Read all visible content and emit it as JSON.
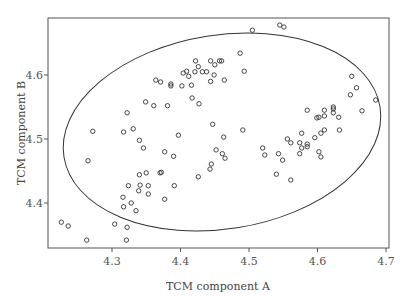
{
  "chart_data": {
    "type": "scatter",
    "title": "",
    "xlabel": "TCM component A",
    "ylabel": "TCM component B",
    "xlim": [
      4.21,
      4.705
    ],
    "ylim": [
      4.332,
      4.692
    ],
    "xticks": [
      4.3,
      4.4,
      4.5,
      4.6,
      4.7
    ],
    "yticks": [
      4.4,
      4.5,
      4.6
    ],
    "xtick_labels": [
      "4.3",
      "4.4",
      "4.5",
      "4.6",
      "4.7"
    ],
    "ytick_labels": [
      "4.4",
      "4.5",
      "4.6"
    ],
    "grid": false,
    "legend": null,
    "marker": "open-circle",
    "annotations": [
      {
        "type": "confidence-ellipse",
        "center": [
          4.465,
          4.511
        ],
        "note": "tilted ellipse enclosing most points"
      }
    ],
    "points": [
      [
        4.505,
        4.67
      ],
      [
        4.545,
        4.678
      ],
      [
        4.551,
        4.675
      ],
      [
        4.487,
        4.634
      ],
      [
        4.422,
        4.622
      ],
      [
        4.444,
        4.622
      ],
      [
        4.457,
        4.622
      ],
      [
        4.46,
        4.622
      ],
      [
        4.426,
        4.613
      ],
      [
        4.45,
        4.616
      ],
      [
        4.404,
        4.603
      ],
      [
        4.409,
        4.606
      ],
      [
        4.412,
        4.598
      ],
      [
        4.421,
        4.605
      ],
      [
        4.432,
        4.605
      ],
      [
        4.438,
        4.605
      ],
      [
        4.449,
        4.6
      ],
      [
        4.493,
        4.606
      ],
      [
        4.364,
        4.592
      ],
      [
        4.371,
        4.589
      ],
      [
        4.386,
        4.586
      ],
      [
        4.386,
        4.583
      ],
      [
        4.402,
        4.583
      ],
      [
        4.416,
        4.584
      ],
      [
        4.444,
        4.59
      ],
      [
        4.464,
        4.592
      ],
      [
        4.417,
        4.564
      ],
      [
        4.427,
        4.555
      ],
      [
        4.349,
        4.558
      ],
      [
        4.361,
        4.552
      ],
      [
        4.381,
        4.552
      ],
      [
        4.322,
        4.541
      ],
      [
        4.272,
        4.512
      ],
      [
        4.317,
        4.511
      ],
      [
        4.331,
        4.516
      ],
      [
        4.447,
        4.523
      ],
      [
        4.491,
        4.514
      ],
      [
        4.34,
        4.498
      ],
      [
        4.346,
        4.486
      ],
      [
        4.397,
        4.506
      ],
      [
        4.463,
        4.503
      ],
      [
        4.377,
        4.48
      ],
      [
        4.39,
        4.473
      ],
      [
        4.452,
        4.483
      ],
      [
        4.461,
        4.477
      ],
      [
        4.465,
        4.47
      ],
      [
        4.265,
        4.466
      ],
      [
        4.445,
        4.461
      ],
      [
        4.443,
        4.453
      ],
      [
        4.34,
        4.444
      ],
      [
        4.35,
        4.447
      ],
      [
        4.37,
        4.447
      ],
      [
        4.372,
        4.448
      ],
      [
        4.426,
        4.441
      ],
      [
        4.324,
        4.427
      ],
      [
        4.341,
        4.428
      ],
      [
        4.353,
        4.427
      ],
      [
        4.391,
        4.427
      ],
      [
        4.339,
        4.419
      ],
      [
        4.353,
        4.414
      ],
      [
        4.316,
        4.409
      ],
      [
        4.377,
        4.406
      ],
      [
        4.328,
        4.4
      ],
      [
        4.317,
        4.394
      ],
      [
        4.335,
        4.388
      ],
      [
        4.226,
        4.37
      ],
      [
        4.236,
        4.364
      ],
      [
        4.304,
        4.367
      ],
      [
        4.322,
        4.362
      ],
      [
        4.263,
        4.342
      ],
      [
        4.321,
        4.342
      ],
      [
        4.65,
        4.598
      ],
      [
        4.657,
        4.58
      ],
      [
        4.648,
        4.569
      ],
      [
        4.685,
        4.561
      ],
      [
        4.665,
        4.544
      ],
      [
        4.585,
        4.545
      ],
      [
        4.61,
        4.545
      ],
      [
        4.623,
        4.55
      ],
      [
        4.623,
        4.547
      ],
      [
        4.623,
        4.541
      ],
      [
        4.631,
        4.534
      ],
      [
        4.599,
        4.533
      ],
      [
        4.602,
        4.534
      ],
      [
        4.61,
        4.536
      ],
      [
        4.61,
        4.514
      ],
      [
        4.632,
        4.514
      ],
      [
        4.577,
        4.509
      ],
      [
        4.605,
        4.509
      ],
      [
        4.556,
        4.5
      ],
      [
        4.561,
        4.494
      ],
      [
        4.596,
        4.502
      ],
      [
        4.574,
        4.494
      ],
      [
        4.585,
        4.492
      ],
      [
        4.585,
        4.488
      ],
      [
        4.577,
        4.486
      ],
      [
        4.52,
        4.486
      ],
      [
        4.523,
        4.475
      ],
      [
        4.543,
        4.477
      ],
      [
        4.549,
        4.467
      ],
      [
        4.574,
        4.477
      ],
      [
        4.602,
        4.48
      ],
      [
        4.605,
        4.472
      ],
      [
        4.54,
        4.445
      ],
      [
        4.561,
        4.436
      ]
    ]
  }
}
